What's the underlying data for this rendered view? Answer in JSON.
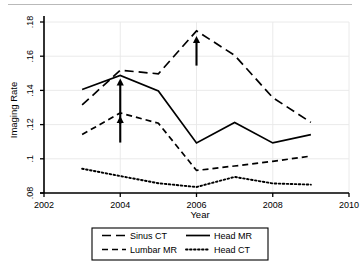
{
  "figure": {
    "kind": "line-chart-figure",
    "top_rule": true,
    "background_color": "#ffffff",
    "line_color": "#000000",
    "grid_color": "#e8e8e8",
    "axis_color": "#000000"
  },
  "chart_data": {
    "type": "line",
    "title": "",
    "subtitle": "",
    "xlabel": "Year",
    "ylabel": "Imaging Rate",
    "x": [
      2003,
      2004,
      2005,
      2006,
      2007,
      2008,
      2009
    ],
    "xlim": [
      2002,
      2010
    ],
    "ylim": [
      0.08,
      0.18
    ],
    "xticks": [
      2002,
      2004,
      2006,
      2008,
      2010
    ],
    "xtick_labels": [
      "2002",
      "2004",
      "2006",
      "2008",
      "2010"
    ],
    "yticks": [
      0.08,
      0.1,
      0.12,
      0.14,
      0.16,
      0.18
    ],
    "ytick_labels": [
      ".08",
      ".1",
      ".12",
      ".14",
      ".16",
      ".18"
    ],
    "grid": "horizontal-and-vertical-light",
    "legend_position": "below-axes-boxed",
    "series": [
      {
        "name": "Sinus CT",
        "style": "long-dash",
        "values": [
          0.1315,
          0.1518,
          0.1497,
          0.1748,
          0.1605,
          0.1358,
          0.1213
        ]
      },
      {
        "name": "Head MR",
        "style": "solid",
        "values": [
          0.1405,
          0.1487,
          0.1397,
          0.1093,
          0.1213,
          0.1093,
          0.1141
        ]
      },
      {
        "name": "Lumbar MR",
        "style": "dash",
        "values": [
          0.1142,
          0.1268,
          0.1208,
          0.0932,
          0.0958,
          0.0985,
          0.1016
        ]
      },
      {
        "name": "Head CT",
        "style": "dotted",
        "values": [
          0.0942,
          0.0899,
          0.0857,
          0.0835,
          0.0894,
          0.0856,
          0.0849
        ]
      }
    ],
    "annotations": [
      {
        "label": "arrow-up-head-mr-2004",
        "x": 2004,
        "y_tip": 0.147,
        "y_tail": 0.1205
      },
      {
        "label": "arrow-up-lumbar-mr-2004",
        "x": 2004,
        "y_tip": 0.125,
        "y_tail": 0.1095
      },
      {
        "label": "arrow-up-sinus-ct-2006",
        "x": 2006,
        "y_tip": 0.1718,
        "y_tail": 0.1545
      }
    ]
  },
  "legend": {
    "entries": [
      {
        "label": "Sinus CT",
        "style": "long-dash"
      },
      {
        "label": "Head MR",
        "style": "solid"
      },
      {
        "label": "Lumbar MR",
        "style": "dash"
      },
      {
        "label": "Head CT",
        "style": "dotted"
      }
    ]
  }
}
